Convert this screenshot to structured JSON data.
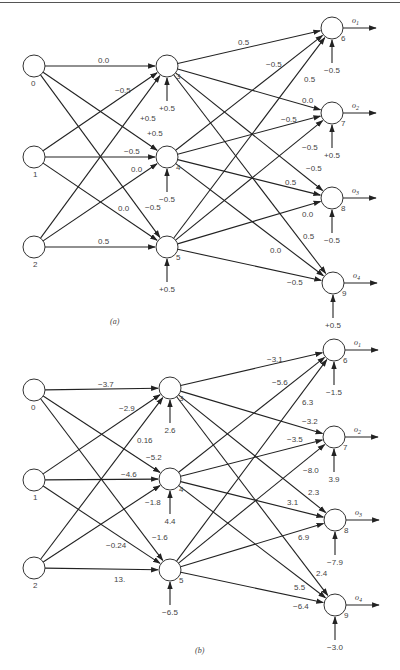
{
  "diagrams": [
    {
      "caption": "(a)",
      "nodes": [
        {
          "id": "0",
          "x": 34,
          "y": 66
        },
        {
          "id": "1",
          "x": 34,
          "y": 157
        },
        {
          "id": "2",
          "x": 34,
          "y": 247
        },
        {
          "id": "3",
          "x": 167,
          "y": 66
        },
        {
          "id": "4",
          "x": 167,
          "y": 157
        },
        {
          "id": "5",
          "x": 167,
          "y": 247
        },
        {
          "id": "6",
          "x": 332,
          "y": 28
        },
        {
          "id": "7",
          "x": 332,
          "y": 113
        },
        {
          "id": "8",
          "x": 332,
          "y": 198
        },
        {
          "id": "9",
          "x": 333,
          "y": 283
        }
      ],
      "outputs": [
        {
          "node": "6",
          "label": "o1"
        },
        {
          "node": "7",
          "label": "o2"
        },
        {
          "node": "8",
          "label": "o3"
        },
        {
          "node": "9",
          "label": "o4"
        }
      ],
      "biases": [
        {
          "node": "3",
          "value": "+0.5"
        },
        {
          "node": "4",
          "value": "−0.5"
        },
        {
          "node": "5",
          "value": "+0.5"
        },
        {
          "node": "6",
          "value": "−0.5"
        },
        {
          "node": "7",
          "value": "+0.5"
        },
        {
          "node": "8",
          "value": "−0.5"
        },
        {
          "node": "9",
          "value": "+0.5"
        }
      ],
      "edges": [
        {
          "from": "0",
          "to": "3",
          "weight": "0.0",
          "lx": 98,
          "ly": 63
        },
        {
          "from": "1",
          "to": "3",
          "weight": "−0.5",
          "lx": 115,
          "ly": 93
        },
        {
          "from": "2",
          "to": "3",
          "weight": "+0.5",
          "lx": 140,
          "ly": 121
        },
        {
          "from": "0",
          "to": "4",
          "weight": "+0.5",
          "lx": 147,
          "ly": 136
        },
        {
          "from": "1",
          "to": "4",
          "weight": "−0.5",
          "lx": 124,
          "ly": 154
        },
        {
          "from": "2",
          "to": "4",
          "weight": "0.0",
          "lx": 131,
          "ly": 172
        },
        {
          "from": "0",
          "to": "5",
          "weight": "−0.5",
          "lx": 145,
          "ly": 210
        },
        {
          "from": "1",
          "to": "5",
          "weight": "0.0",
          "lx": 118,
          "ly": 211
        },
        {
          "from": "2",
          "to": "5",
          "weight": "0.5",
          "lx": 98,
          "ly": 244
        },
        {
          "from": "3",
          "to": "6",
          "weight": "0.5",
          "lx": 238,
          "ly": 45
        },
        {
          "from": "4",
          "to": "6",
          "weight": "−0.5",
          "lx": 266,
          "ly": 67
        },
        {
          "from": "5",
          "to": "6",
          "weight": "0.5",
          "lx": 304,
          "ly": 82
        },
        {
          "from": "3",
          "to": "7",
          "weight": "0.0",
          "lx": 302,
          "ly": 103
        },
        {
          "from": "4",
          "to": "7",
          "weight": "−0.5",
          "lx": 281,
          "ly": 122
        },
        {
          "from": "5",
          "to": "7",
          "weight": "−0.5",
          "lx": 302,
          "ly": 150
        },
        {
          "from": "3",
          "to": "8",
          "weight": "−0.5",
          "lx": 306,
          "ly": 171
        },
        {
          "from": "4",
          "to": "8",
          "weight": "0.5",
          "lx": 285,
          "ly": 185
        },
        {
          "from": "5",
          "to": "8",
          "weight": "0.0",
          "lx": 302,
          "ly": 217
        },
        {
          "from": "3",
          "to": "9",
          "weight": "0.5",
          "lx": 303,
          "ly": 239
        },
        {
          "from": "4",
          "to": "9",
          "weight": "0.0",
          "lx": 270,
          "ly": 253
        },
        {
          "from": "5",
          "to": "9",
          "weight": "−0.5",
          "lx": 287,
          "ly": 285
        }
      ]
    },
    {
      "caption": "(b)",
      "nodes": [
        {
          "id": "0",
          "x": 34,
          "y": 390
        },
        {
          "id": "1",
          "x": 34,
          "y": 480
        },
        {
          "id": "2",
          "x": 34,
          "y": 568
        },
        {
          "id": "3",
          "x": 170,
          "y": 388
        },
        {
          "id": "4",
          "x": 170,
          "y": 479
        },
        {
          "id": "5",
          "x": 170,
          "y": 570
        },
        {
          "id": "6",
          "x": 334,
          "y": 350
        },
        {
          "id": "7",
          "x": 334,
          "y": 437
        },
        {
          "id": "8",
          "x": 335,
          "y": 520
        },
        {
          "id": "9",
          "x": 335,
          "y": 605
        }
      ],
      "outputs": [
        {
          "node": "6",
          "label": "o1"
        },
        {
          "node": "7",
          "label": "o2"
        },
        {
          "node": "8",
          "label": "o3"
        },
        {
          "node": "9",
          "label": "o4"
        }
      ],
      "biases": [
        {
          "node": "3",
          "value": "2.6"
        },
        {
          "node": "4",
          "value": "4.4"
        },
        {
          "node": "5",
          "value": "−6.5"
        },
        {
          "node": "6",
          "value": "−1.5"
        },
        {
          "node": "7",
          "value": "3.9"
        },
        {
          "node": "8",
          "value": "−7.9"
        },
        {
          "node": "9",
          "value": "−3.0"
        }
      ],
      "edges": [
        {
          "from": "0",
          "to": "3",
          "weight": "−3.7",
          "lx": 98,
          "ly": 387
        },
        {
          "from": "1",
          "to": "3",
          "weight": "−2.9",
          "lx": 119,
          "ly": 411
        },
        {
          "from": "2",
          "to": "3",
          "weight": "0.16",
          "lx": 137,
          "ly": 443
        },
        {
          "from": "0",
          "to": "4",
          "weight": "−5.2",
          "lx": 146,
          "ly": 460
        },
        {
          "from": "1",
          "to": "4",
          "weight": "−4.6",
          "lx": 121,
          "ly": 477
        },
        {
          "from": "2",
          "to": "4",
          "weight": "−1.8",
          "lx": 145,
          "ly": 505
        },
        {
          "from": "0",
          "to": "5",
          "weight": "−1.6",
          "lx": 152,
          "ly": 540
        },
        {
          "from": "1",
          "to": "5",
          "weight": "−0.24",
          "lx": 106,
          "ly": 548
        },
        {
          "from": "2",
          "to": "5",
          "weight": "13.",
          "lx": 114,
          "ly": 582
        },
        {
          "from": "3",
          "to": "6",
          "weight": "−3.1",
          "lx": 267,
          "ly": 362
        },
        {
          "from": "4",
          "to": "6",
          "weight": "−5.6",
          "lx": 272,
          "ly": 385
        },
        {
          "from": "5",
          "to": "6",
          "weight": "6.3",
          "lx": 302,
          "ly": 405
        },
        {
          "from": "3",
          "to": "7",
          "weight": "−3.2",
          "lx": 302,
          "ly": 424
        },
        {
          "from": "4",
          "to": "7",
          "weight": "−3.5",
          "lx": 287,
          "ly": 442
        },
        {
          "from": "5",
          "to": "7",
          "weight": "−8.0",
          "lx": 303,
          "ly": 473
        },
        {
          "from": "3",
          "to": "8",
          "weight": "2.3",
          "lx": 308,
          "ly": 495
        },
        {
          "from": "4",
          "to": "8",
          "weight": "3.1",
          "lx": 287,
          "ly": 505
        },
        {
          "from": "5",
          "to": "8",
          "weight": "6.9",
          "lx": 298,
          "ly": 540
        },
        {
          "from": "3",
          "to": "9",
          "weight": "2.4",
          "lx": 316,
          "ly": 576
        },
        {
          "from": "4",
          "to": "9",
          "weight": "5.5",
          "lx": 294,
          "ly": 590
        },
        {
          "from": "5",
          "to": "9",
          "weight": "−6.4",
          "lx": 293,
          "ly": 609
        }
      ]
    }
  ]
}
